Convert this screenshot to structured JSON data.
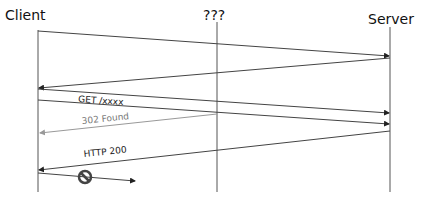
{
  "participants": [
    {
      "name": "Client",
      "x": 38
    },
    {
      "name": "???",
      "x": 217
    },
    {
      "name": "Server",
      "x": 390
    }
  ],
  "messages": [
    {
      "label": "",
      "from": "Client",
      "to": "Server"
    },
    {
      "label": "",
      "from": "Server",
      "to": "Client"
    },
    {
      "label": "GET /xxxx",
      "from": "Client",
      "to": "Server"
    },
    {
      "label": "",
      "from": "Client",
      "to": "Server"
    },
    {
      "label": "302 Found",
      "from": "???",
      "to": "Client",
      "color": "#808080"
    },
    {
      "label": "HTTP 200",
      "from": "Server",
      "to": "Client"
    },
    {
      "label": "",
      "from": "Client",
      "to": "blocked",
      "icon": "no-entry-icon"
    }
  ],
  "colors": {
    "line": "#444444",
    "gray": "#909090"
  }
}
